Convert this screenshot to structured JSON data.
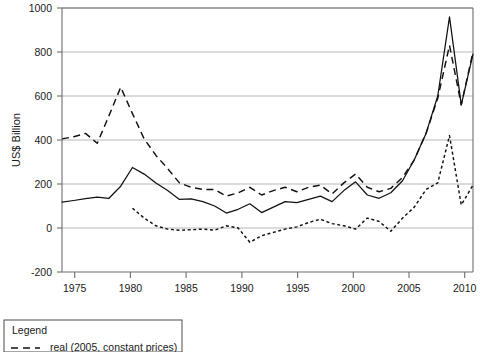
{
  "chart_data": {
    "type": "line",
    "title": "",
    "xlabel": "",
    "ylabel": "US$ Billion",
    "xlim": [
      1975,
      2010
    ],
    "ylim": [
      -200,
      1000
    ],
    "ytick_labels": [
      "1000",
      "800",
      "600",
      "400",
      "200",
      "0",
      "-200"
    ],
    "yticks": [
      1000,
      800,
      600,
      400,
      200,
      0,
      -200
    ],
    "xtick_labels": [
      "1975",
      "1980",
      "1985",
      "1990",
      "1995",
      "2000",
      "2005",
      "2010"
    ],
    "xticks": [
      1975,
      1980,
      1985,
      1990,
      1995,
      2000,
      2005,
      2010
    ],
    "grid": "horizontal",
    "legend_position": "below-left",
    "legend_title": "Legend",
    "series": [
      {
        "name": "nominal",
        "style": "solid",
        "x": [
          1975,
          1976,
          1977,
          1978,
          1979,
          1980,
          1981,
          1982,
          1983,
          1984,
          1985,
          1986,
          1987,
          1988,
          1989,
          1990,
          1991,
          1992,
          1993,
          1994,
          1995,
          1996,
          1997,
          1998,
          1999,
          2000,
          2001,
          2002,
          2003,
          2004,
          2005,
          2006,
          2007,
          2008,
          2009,
          2010
        ],
        "values": [
          118,
          125,
          133,
          140,
          135,
          190,
          275,
          245,
          205,
          170,
          130,
          132,
          120,
          100,
          68,
          85,
          110,
          70,
          95,
          120,
          115,
          130,
          145,
          120,
          170,
          210,
          150,
          135,
          160,
          215,
          310,
          430,
          600,
          960,
          560,
          790
        ]
      },
      {
        "name": "real (2005, constant prices)",
        "style": "dashed",
        "x": [
          1975,
          1976,
          1977,
          1978,
          1979,
          1980,
          1981,
          1982,
          1983,
          1984,
          1985,
          1986,
          1987,
          1988,
          1989,
          1990,
          1991,
          1992,
          1993,
          1994,
          1995,
          1996,
          1997,
          1998,
          1999,
          2000,
          2001,
          2002,
          2003,
          2004,
          2005,
          2006,
          2007,
          2008,
          2009,
          2010
        ],
        "values": [
          405,
          415,
          430,
          385,
          510,
          640,
          520,
          405,
          330,
          270,
          205,
          185,
          175,
          175,
          145,
          160,
          185,
          150,
          170,
          185,
          165,
          185,
          195,
          155,
          205,
          245,
          185,
          165,
          180,
          230,
          310,
          430,
          590,
          830,
          560,
          800
        ]
      },
      {
        "name": "deflated / net",
        "style": "dotted",
        "x": [
          1981,
          1982,
          1983,
          1984,
          1985,
          1986,
          1987,
          1988,
          1989,
          1990,
          1991,
          1992,
          1993,
          1994,
          1995,
          1996,
          1997,
          1998,
          1999,
          2000,
          2001,
          2002,
          2003,
          2004,
          2005,
          2006,
          2007,
          2008,
          2009,
          2010
        ],
        "values": [
          90,
          45,
          10,
          -5,
          -10,
          -8,
          -5,
          -10,
          10,
          0,
          -65,
          -35,
          -20,
          -5,
          5,
          25,
          40,
          20,
          10,
          -5,
          45,
          30,
          -15,
          45,
          95,
          175,
          205,
          420,
          105,
          195
        ]
      }
    ]
  },
  "axis": {
    "ylabel": "US$ Billion"
  },
  "legend": {
    "title": "Legend",
    "entries": [
      {
        "label": "real (2005, constant prices)",
        "style": "dashed"
      }
    ]
  }
}
